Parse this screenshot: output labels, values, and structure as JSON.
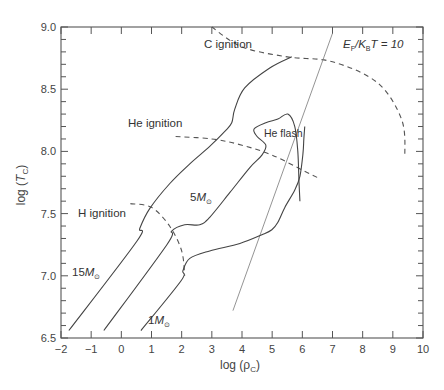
{
  "chart_data": {
    "type": "line",
    "title": "",
    "xlabel": "log (ρ_C)",
    "ylabel": "log (T_C)",
    "xlim": [
      -2,
      10
    ],
    "ylim": [
      6.5,
      9.0
    ],
    "grid": false,
    "legend": "none (inline labels)",
    "x_ticks": [
      "-2",
      "-1",
      "0",
      "1",
      "2",
      "3",
      "4",
      "5",
      "6",
      "7",
      "8",
      "9",
      "10"
    ],
    "y_ticks": [
      "6.5",
      "7.0",
      "7.5",
      "8.0",
      "8.5",
      "9.0"
    ],
    "series": [
      {
        "name": "15M☉",
        "style": "solid",
        "points": [
          [
            -1.74,
            6.56
          ],
          [
            0.52,
            7.28
          ],
          [
            0.61,
            7.38
          ],
          [
            0.94,
            7.54
          ],
          [
            1.6,
            7.74
          ],
          [
            2.27,
            7.9
          ],
          [
            2.93,
            8.04
          ],
          [
            3.43,
            8.16
          ],
          [
            3.66,
            8.23
          ],
          [
            3.76,
            8.34
          ],
          [
            4.09,
            8.51
          ],
          [
            4.92,
            8.67
          ],
          [
            5.65,
            8.76
          ]
        ]
      },
      {
        "name": "5M☉",
        "style": "solid",
        "points": [
          [
            -0.58,
            6.56
          ],
          [
            1.51,
            7.25
          ],
          [
            1.67,
            7.36
          ],
          [
            2.1,
            7.41
          ],
          [
            2.6,
            7.41
          ],
          [
            2.93,
            7.47
          ],
          [
            3.6,
            7.67
          ],
          [
            4.26,
            7.87
          ],
          [
            4.66,
            7.97
          ],
          [
            4.79,
            8.05
          ],
          [
            4.5,
            8.12
          ],
          [
            4.4,
            8.18
          ],
          [
            4.79,
            8.23
          ],
          [
            5.19,
            8.26
          ],
          [
            5.52,
            8.3
          ],
          [
            5.75,
            8.2
          ],
          [
            5.85,
            8.0
          ],
          [
            5.89,
            7.75
          ],
          [
            5.92,
            7.6
          ]
        ]
      },
      {
        "name": "1M☉",
        "style": "solid",
        "points": [
          [
            0.65,
            6.56
          ],
          [
            1.98,
            6.96
          ],
          [
            2.04,
            7.04
          ],
          [
            2.27,
            7.14
          ],
          [
            2.93,
            7.2
          ],
          [
            3.93,
            7.26
          ],
          [
            4.66,
            7.33
          ],
          [
            4.99,
            7.37
          ],
          [
            5.19,
            7.43
          ],
          [
            5.42,
            7.55
          ],
          [
            5.75,
            7.69
          ],
          [
            5.92,
            7.8
          ],
          [
            6.02,
            7.98
          ],
          [
            6.05,
            8.1
          ],
          [
            6.08,
            8.2
          ]
        ]
      }
    ],
    "lines": [
      {
        "name": "H ignition",
        "style": "dashed",
        "points": [
          [
            0.3,
            7.58
          ],
          [
            1.0,
            7.55
          ],
          [
            1.6,
            7.4
          ],
          [
            2.0,
            7.2
          ],
          [
            2.1,
            7.0
          ]
        ]
      },
      {
        "name": "He ignition",
        "style": "dashed",
        "points": [
          [
            1.8,
            8.12
          ],
          [
            3.0,
            8.1
          ],
          [
            4.0,
            8.05
          ],
          [
            5.0,
            7.97
          ],
          [
            6.0,
            7.85
          ],
          [
            6.5,
            7.79
          ]
        ]
      },
      {
        "name": "C ignition",
        "style": "dashed",
        "points": [
          [
            3.0,
            9.0
          ],
          [
            4.0,
            8.84
          ],
          [
            5.5,
            8.76
          ],
          [
            7.0,
            8.72
          ],
          [
            8.5,
            8.55
          ],
          [
            9.3,
            8.25
          ],
          [
            9.4,
            7.95
          ]
        ]
      },
      {
        "name": "E_F/k_B T = 10",
        "style": "solid-thin",
        "points": [
          [
            3.7,
            6.72
          ],
          [
            7.0,
            8.95
          ]
        ]
      }
    ],
    "annotations": [
      {
        "text": "C ignition",
        "x": 1.6,
        "y": 8.8
      },
      {
        "text": "He ignition",
        "x": -0.2,
        "y": 8.18
      },
      {
        "text": "H ignition",
        "x": -1.5,
        "y": 7.55
      },
      {
        "text": "He flash",
        "x": 4.75,
        "y": 8.13
      },
      {
        "text": "5M☉",
        "x": 2.3,
        "y": 7.5
      },
      {
        "text": "15M☉",
        "x": -1.5,
        "y": 6.98
      },
      {
        "text": "1M☉",
        "x": 1.0,
        "y": 6.58
      },
      {
        "text": "E_F/K_B T = 10",
        "x": 6.8,
        "y": 8.9
      }
    ]
  },
  "labels": {
    "xlabel_main": "log (ρ",
    "xlabel_sub": "C",
    "xlabel_end": ")",
    "ylabel_main": "log (",
    "ylabel_T": "T",
    "ylabel_sub": "C",
    "ylabel_end": ")",
    "c_ignition": "C ignition",
    "he_ignition": "He ignition",
    "h_ignition": "H ignition",
    "he_flash": "He flash",
    "m5_num": "5",
    "m15_num": "15",
    "m1_num": "1",
    "mass_symbol": "M",
    "sun_sub": "⊙",
    "fermi_E": "E",
    "fermi_F": "F",
    "fermi_K": "/K",
    "fermi_B": "B",
    "fermi_rest": "T = 10"
  }
}
